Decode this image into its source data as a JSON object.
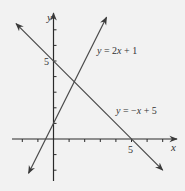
{
  "chart_data": {
    "type": "line",
    "title": "",
    "xlabel": "x",
    "ylabel": "y",
    "xlim": [
      -2.5,
      7.8
    ],
    "ylim": [
      -2.7,
      8
    ],
    "grid": false,
    "x_tick_step": 1,
    "y_tick_step": 1,
    "x_tick_labels": [
      {
        "value": 5,
        "label": "5"
      }
    ],
    "y_tick_labels": [
      {
        "value": 5,
        "label": "5"
      }
    ],
    "series": [
      {
        "name": "y = 2x + 1",
        "slope": 2,
        "intercept": 1,
        "x": [
          -1.6,
          3.4
        ],
        "y": [
          -2.2,
          7.8
        ],
        "label_pos": {
          "x": 2.8,
          "y": 5.7
        }
      },
      {
        "name": "y = −x + 5",
        "slope": -1,
        "intercept": 5,
        "x": [
          -2.4,
          7.0
        ],
        "y": [
          7.4,
          -2.0
        ],
        "label_pos": {
          "x": 4.0,
          "y": 1.7
        }
      }
    ],
    "intersection": {
      "x": 1.333,
      "y": 3.667
    },
    "annotations": []
  },
  "labels": {
    "x_axis": "x",
    "y_axis": "y",
    "x_tick_5": "5",
    "y_tick_5": "5",
    "line1_y": "y",
    "line1_rest": " = 2",
    "line1_x": "x",
    "line1_tail": " + 1",
    "line2_y": "y",
    "line2_rest": " = −",
    "line2_x": "x",
    "line2_tail": " + 5"
  },
  "colors": {
    "background": "#f2f2f2",
    "axis": "#2a2a2a",
    "line": "#4a4a4a",
    "text": "#333333"
  }
}
